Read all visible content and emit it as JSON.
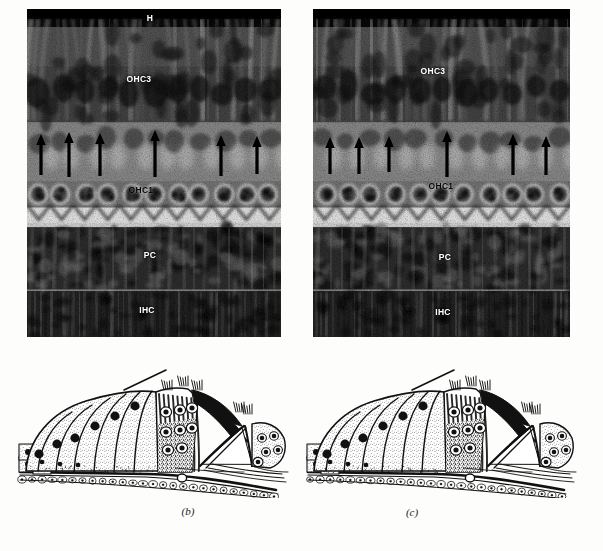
{
  "figure": {
    "background_color": "#fdfdfb",
    "width": 603,
    "height": 551
  },
  "panels": [
    {
      "id": "micrograph-left",
      "kind": "micrograph",
      "caption": "",
      "rect": {
        "x": 27,
        "y": 9,
        "w": 254,
        "h": 328
      },
      "labels": [
        {
          "text": "H",
          "x": 150,
          "y": 18,
          "style": "light"
        },
        {
          "text": "OHC3",
          "x": 139,
          "y": 79,
          "style": "light"
        },
        {
          "text": "OHC1",
          "x": 141,
          "y": 190,
          "style": "dark"
        },
        {
          "text": "PC",
          "x": 150,
          "y": 255,
          "style": "light"
        },
        {
          "text": "IHC",
          "x": 147,
          "y": 310,
          "style": "light"
        }
      ],
      "arrows": [
        {
          "x": 41,
          "y_tip": 134,
          "y_tail": 173
        },
        {
          "x": 69,
          "y_tip": 132,
          "y_tail": 175
        },
        {
          "x": 100,
          "y_tip": 133,
          "y_tail": 174
        },
        {
          "x": 155,
          "y_tip": 130,
          "y_tail": 175
        },
        {
          "x": 221,
          "y_tip": 135,
          "y_tail": 174
        },
        {
          "x": 257,
          "y_tip": 136,
          "y_tail": 172
        }
      ]
    },
    {
      "id": "micrograph-right",
      "kind": "micrograph",
      "caption": "",
      "rect": {
        "x": 313,
        "y": 9,
        "w": 257,
        "h": 328
      },
      "labels": [
        {
          "text": "OHC3",
          "x": 433,
          "y": 71,
          "style": "light"
        },
        {
          "text": "OHC1",
          "x": 441,
          "y": 186,
          "style": "dark"
        },
        {
          "text": "PC",
          "x": 445,
          "y": 257,
          "style": "light"
        },
        {
          "text": "IHC",
          "x": 443,
          "y": 312,
          "style": "light"
        }
      ],
      "arrows": [
        {
          "x": 330,
          "y_tip": 137,
          "y_tail": 172
        },
        {
          "x": 359,
          "y_tip": 137,
          "y_tail": 172
        },
        {
          "x": 389,
          "y_tip": 136,
          "y_tail": 170
        },
        {
          "x": 447,
          "y_tip": 131,
          "y_tail": 175
        },
        {
          "x": 513,
          "y_tip": 134,
          "y_tail": 173
        },
        {
          "x": 546,
          "y_tip": 136,
          "y_tail": 173
        }
      ]
    },
    {
      "id": "diagram-left",
      "kind": "line-drawing",
      "caption": "(b)",
      "caption_x": 188,
      "caption_y": 511,
      "rect": {
        "x": 16,
        "y": 368,
        "w": 282,
        "h": 130
      }
    },
    {
      "id": "diagram-right",
      "kind": "line-drawing",
      "caption": "(c)",
      "caption_x": 412,
      "caption_y": 512,
      "rect": {
        "x": 300,
        "y": 368,
        "w": 290,
        "h": 130
      }
    }
  ],
  "legend": {
    "abbreviations": [
      {
        "key": "H",
        "meaning": "Hensen cells"
      },
      {
        "key": "OHC3",
        "meaning": "Outer hair cell row 3"
      },
      {
        "key": "OHC1",
        "meaning": "Outer hair cell row 1"
      },
      {
        "key": "PC",
        "meaning": "Pillar cells"
      },
      {
        "key": "IHC",
        "meaning": "Inner hair cells"
      }
    ]
  },
  "colors": {
    "label_light": "#ffffff",
    "label_dark": "#0c0c0c",
    "arrow": "#000000",
    "ink": "#111111",
    "paper": "#fdfdfb"
  }
}
